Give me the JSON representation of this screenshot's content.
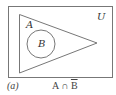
{
  "figure": {
    "universe_label": "U",
    "set_a_label": "A",
    "set_b_label": "B",
    "caption_label": "(a)",
    "expression": {
      "left": "A",
      "operator": "∩",
      "right": "B",
      "right_complemented": true
    },
    "colors": {
      "stroke": "#777777",
      "text": "#333333"
    }
  }
}
